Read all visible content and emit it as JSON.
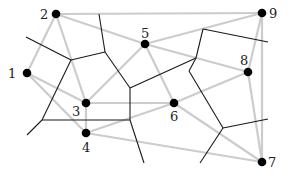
{
  "diagram": {
    "type": "voronoi-delaunay",
    "colors": {
      "background": "#ffffff",
      "delaunay_edge": "#cccccc",
      "voronoi_edge": "#1a1a1a",
      "site": "#000000",
      "label": "#222222"
    },
    "sites": [
      {
        "id": "1",
        "label": "1",
        "x": 27,
        "y": 73,
        "lx": 8,
        "ly": 78
      },
      {
        "id": "2",
        "label": "2",
        "x": 56,
        "y": 14,
        "lx": 40,
        "ly": 19
      },
      {
        "id": "3",
        "label": "3",
        "x": 86,
        "y": 103,
        "lx": 72,
        "ly": 116
      },
      {
        "id": "4",
        "label": "4",
        "x": 86,
        "y": 133,
        "lx": 82,
        "ly": 152
      },
      {
        "id": "5",
        "label": "5",
        "x": 145,
        "y": 44,
        "lx": 141,
        "ly": 38
      },
      {
        "id": "6",
        "label": "6",
        "x": 174,
        "y": 103,
        "lx": 170,
        "ly": 121
      },
      {
        "id": "7",
        "label": "7",
        "x": 262,
        "y": 162,
        "lx": 268,
        "ly": 167
      },
      {
        "id": "8",
        "label": "8",
        "x": 248,
        "y": 72,
        "lx": 240,
        "ly": 65
      },
      {
        "id": "9",
        "label": "9",
        "x": 262,
        "y": 13,
        "lx": 269,
        "ly": 18
      }
    ],
    "delaunay_edges": [
      [
        "1",
        "2"
      ],
      [
        "1",
        "3"
      ],
      [
        "1",
        "4"
      ],
      [
        "2",
        "3"
      ],
      [
        "2",
        "5"
      ],
      [
        "2",
        "9"
      ],
      [
        "3",
        "4"
      ],
      [
        "3",
        "5"
      ],
      [
        "3",
        "6"
      ],
      [
        "4",
        "6"
      ],
      [
        "4",
        "7"
      ],
      [
        "5",
        "6"
      ],
      [
        "5",
        "9"
      ],
      [
        "5",
        "8"
      ],
      [
        "6",
        "8"
      ],
      [
        "6",
        "7"
      ],
      [
        "8",
        "9"
      ],
      [
        "8",
        "7"
      ],
      [
        "9",
        "7"
      ]
    ],
    "voronoi_edges": [
      [
        26,
        37,
        71,
        60
      ],
      [
        71,
        60,
        105,
        52
      ],
      [
        105,
        52,
        99,
        14
      ],
      [
        71,
        60,
        42,
        120
      ],
      [
        42,
        120,
        27,
        135
      ],
      [
        42,
        120,
        130,
        120
      ],
      [
        105,
        52,
        130,
        88
      ],
      [
        130,
        88,
        196,
        58
      ],
      [
        196,
        58,
        203,
        29
      ],
      [
        196,
        58,
        189,
        71
      ],
      [
        203,
        29,
        268,
        42
      ],
      [
        189,
        71,
        223,
        128
      ],
      [
        223,
        128,
        268,
        119
      ],
      [
        223,
        128,
        200,
        163
      ],
      [
        130,
        120,
        130,
        88
      ],
      [
        130,
        120,
        144,
        163
      ]
    ]
  }
}
